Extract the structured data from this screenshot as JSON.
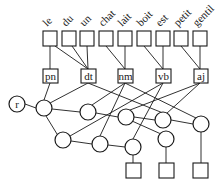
{
  "diagram": {
    "words": [
      "le",
      "du",
      "un",
      "chat",
      "lait",
      "boit",
      "est",
      "petit",
      "gentil"
    ],
    "pos_tags": [
      "pn",
      "dt",
      "nm",
      "vb",
      "aj"
    ],
    "root_label": "r",
    "colors": {
      "stroke": "#1a1a1a",
      "background": "#ffffff"
    }
  }
}
